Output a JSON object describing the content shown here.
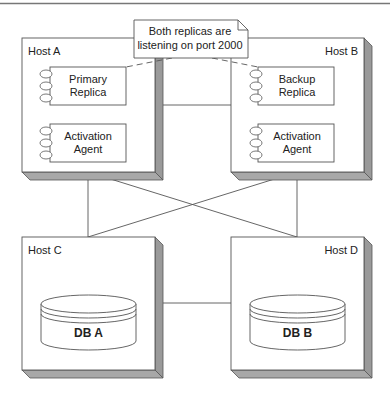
{
  "colors": {
    "stroke": "#555555",
    "shadow": "#9a9a9a",
    "shadow_dark": "#7a7a7a",
    "fill": "#ffffff",
    "text": "#222222"
  },
  "note": {
    "line1": "Both replicas are",
    "line2": "listening on port 2000"
  },
  "hosts": [
    {
      "label": "Host A",
      "components": [
        {
          "line1": "Primary",
          "line2": "Replica"
        },
        {
          "line1": "Activation",
          "line2": "Agent"
        }
      ]
    },
    {
      "label": "Host B",
      "components": [
        {
          "line1": "Backup",
          "line2": "Replica"
        },
        {
          "line1": "Activation",
          "line2": "Agent"
        }
      ]
    },
    {
      "label": "Host C",
      "database": "DB A"
    },
    {
      "label": "Host D",
      "database": "DB B"
    }
  ],
  "connections": [
    {
      "from": "Host A",
      "to": "Host B",
      "style": "solid"
    },
    {
      "from": "Host A",
      "to": "Host C",
      "style": "solid"
    },
    {
      "from": "Host A",
      "to": "Host D",
      "style": "solid"
    },
    {
      "from": "Host B",
      "to": "Host C",
      "style": "solid"
    },
    {
      "from": "Host B",
      "to": "Host D",
      "style": "solid"
    },
    {
      "from": "Host C",
      "to": "Host D",
      "style": "solid"
    },
    {
      "from": "Note",
      "to": "Primary Replica",
      "style": "dashed"
    },
    {
      "from": "Note",
      "to": "Backup Replica",
      "style": "dashed"
    }
  ]
}
